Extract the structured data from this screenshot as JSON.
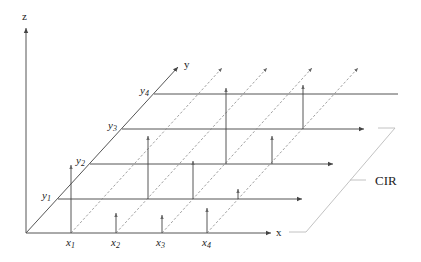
{
  "diagram": {
    "type": "3d-axes-grid",
    "colors": {
      "axis": "#555555",
      "dashed": "#888888",
      "bracket": "#bbbbbb",
      "text": "#222222"
    },
    "axes": {
      "z": {
        "label": "z"
      },
      "y": {
        "label": "y"
      },
      "x": {
        "label": "x"
      }
    },
    "x_ticks": [
      {
        "base": "x",
        "sub": "1"
      },
      {
        "base": "x",
        "sub": "2"
      },
      {
        "base": "x",
        "sub": "3"
      },
      {
        "base": "x",
        "sub": "4"
      }
    ],
    "y_ticks": [
      {
        "base": "y",
        "sub": "1"
      },
      {
        "base": "y",
        "sub": "2"
      },
      {
        "base": "y",
        "sub": "3"
      },
      {
        "base": "y",
        "sub": "4"
      }
    ],
    "annotation": {
      "label": "CIR"
    },
    "impulses": [
      {
        "row": "y0",
        "x": 71,
        "height": 68
      },
      {
        "row": "y0",
        "x": 116,
        "height": 20
      },
      {
        "row": "y0",
        "x": 162,
        "height": 18
      },
      {
        "row": "y0",
        "x": 207,
        "height": 25
      },
      {
        "row": "y1",
        "x": 148,
        "height": 63
      },
      {
        "row": "y1",
        "x": 193,
        "height": 38
      },
      {
        "row": "y1",
        "x": 238,
        "height": 10
      },
      {
        "row": "y2",
        "x": 226,
        "height": 76
      },
      {
        "row": "y2",
        "x": 272,
        "height": 28
      },
      {
        "row": "y3",
        "x": 303,
        "height": 44
      }
    ]
  }
}
